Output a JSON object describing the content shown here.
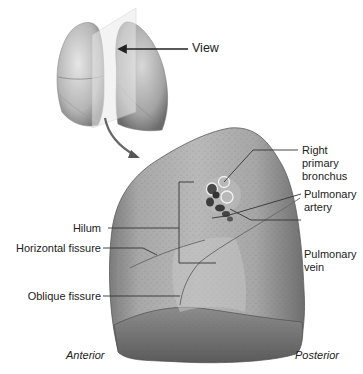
{
  "diagram": {
    "view_label": "View",
    "labels": {
      "right_primary_bronchus": [
        "Right",
        "primary",
        "bronchus"
      ],
      "pulmonary_artery": [
        "Pulmonary",
        "artery"
      ],
      "pulmonary_vein": [
        "Pulmonary",
        "vein"
      ],
      "hilum": "Hilum",
      "horizontal_fissure": "Horizontal fissure",
      "oblique_fissure": "Oblique fissure",
      "anterior": "Anterior",
      "posterior": "Posterior"
    },
    "colors": {
      "lung_light": "#cfcfcf",
      "lung_mid": "#9a9a9a",
      "lung_dark": "#5e5e5e",
      "leader_line": "#333333",
      "text": "#222222",
      "background": "#ffffff"
    }
  }
}
